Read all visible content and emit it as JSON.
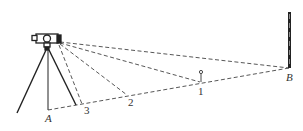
{
  "diagram": {
    "colors": {
      "line": "#222222",
      "dashed": "#444444",
      "background": "#ffffff"
    },
    "labels": {
      "A": "A",
      "B": "B",
      "p1": "1",
      "p2": "2",
      "p3": "3"
    },
    "nodes": [
      {
        "id": "instrument",
        "desc": "level instrument on tripod",
        "x": 47,
        "y": 38
      },
      {
        "id": "A",
        "x": 48,
        "y": 110
      },
      {
        "id": "3",
        "x": 82,
        "y": 104
      },
      {
        "id": "2",
        "x": 127,
        "y": 95
      },
      {
        "id": "1",
        "x": 200,
        "y": 82
      },
      {
        "id": "B",
        "x": 289,
        "y": 68
      }
    ],
    "edges": [
      {
        "from": "instrument",
        "to": "B",
        "style": "dashed"
      },
      {
        "from": "instrument",
        "to": "1",
        "style": "dashed"
      },
      {
        "from": "instrument",
        "to": "2",
        "style": "dashed"
      },
      {
        "from": "instrument",
        "to": "3",
        "style": "dashed"
      },
      {
        "from": "A",
        "to": "B",
        "style": "dashed",
        "via": [
          "3",
          "2",
          "1"
        ]
      }
    ]
  }
}
